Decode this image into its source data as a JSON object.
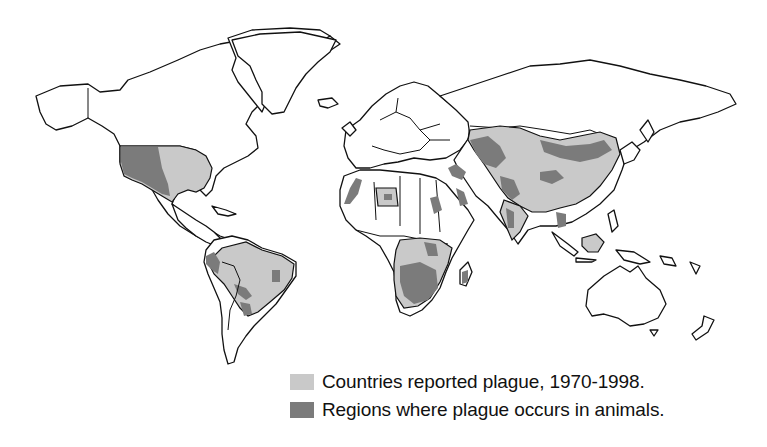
{
  "map": {
    "type": "world choropleth",
    "projection": "world outline, black country borders on white",
    "colors": {
      "background": "#ffffff",
      "outline": "#111111",
      "reported": "#c9c9c9",
      "animals": "#7b7b7b"
    },
    "reported_regions": [
      "United States (eastern)",
      "Peru",
      "Bolivia",
      "Brazil",
      "Ecuador",
      "Libya",
      "Kazakhstan",
      "Mongolia",
      "China",
      "India",
      "Myanmar",
      "Vietnam",
      "Indonesia",
      "Democratic Republic of the Congo",
      "Tanzania",
      "Uganda",
      "Kenya",
      "Mozambique",
      "Zambia",
      "Zimbabwe",
      "Namibia",
      "Botswana",
      "South Africa",
      "Madagascar",
      "Angola"
    ],
    "animal_regions": [
      "Western United States",
      "Andean Peru",
      "Bolivia/Paraguay",
      "Southern Brazil",
      "Eastern Brazil (small zone)",
      "Morocco/Algeria coast",
      "Arabian Peninsula (west)",
      "Caucasus / Caspian",
      "Central Asia (Kazakhstan)",
      "Mongolia",
      "Northeast China",
      "Central China",
      "Yunnan/Tibet",
      "Western India",
      "Southeast Asia",
      "Southern Africa (Namibia/Botswana/South Africa)",
      "East Africa lakes",
      "Madagascar"
    ]
  },
  "legend": {
    "items": [
      {
        "label": "Countries reported plague, 1970-1998.",
        "color": "#c9c9c9"
      },
      {
        "label": "Regions where plague occurs in animals.",
        "color": "#7b7b7b"
      }
    ]
  }
}
